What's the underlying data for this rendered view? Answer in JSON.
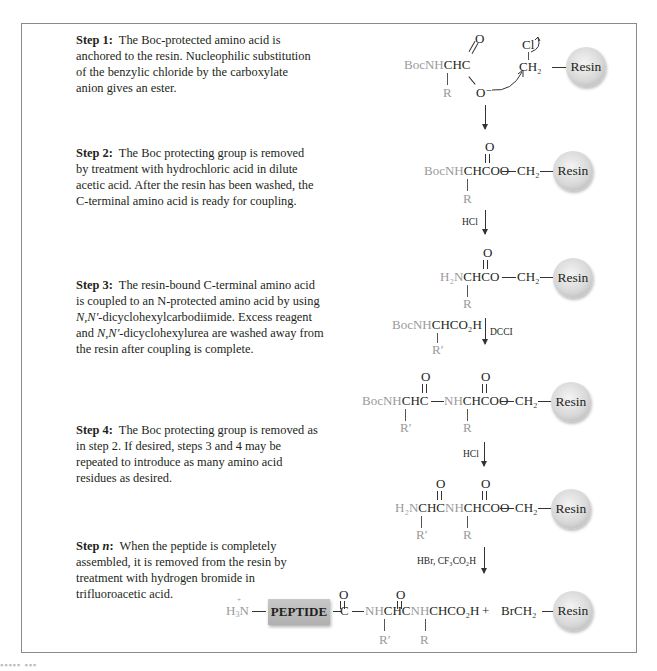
{
  "steps": [
    {
      "label": "Step 1:",
      "text": "The Boc-protected amino acid is anchored to the resin. Nucleophilic substitution of the benzylic chloride by the carboxylate anion gives an ester."
    },
    {
      "label": "Step 2:",
      "text": "The Boc protecting group is removed by treatment with hydrochloric acid in dilute acetic acid. After the resin has been washed, the C-terminal amino acid is ready for coupling."
    },
    {
      "label": "Step 3:",
      "text_before": "The resin-bound C-terminal amino acid is coupled to an N-protected amino acid by using ",
      "italic1": "N,N′",
      "text_mid": "-dicyclohexylcarbodiimide. Excess reagent and ",
      "italic2": "N,N′",
      "text_after": "-dicyclohexylurea are washed away from the resin after coupling is complete."
    },
    {
      "label": "Step 4:",
      "text": "The Boc protecting group is removed as in step 2. If desired, steps 3 and 4 may be repeated to introduce as many amino acid residues as desired."
    },
    {
      "label": "Step ",
      "label_italic": "n",
      "label_colon": ":",
      "text": "When the peptide is completely assembled, it is removed from the resin by treatment with hydrogen bromide in trifluoroacetic acid."
    }
  ],
  "reagents": {
    "step2": "HCl",
    "step3": "DCCI",
    "step4": "HCl",
    "stepn": "HBr, CF₃CO₂H"
  },
  "chem": {
    "boc": "Boc",
    "nh": "NH",
    "h2n": "H₂N",
    "chc": "CHC",
    "chco": "CHCO",
    "o": "O",
    "o_minus": "O⁻",
    "cl": "Cl",
    "ch2": "CH₂",
    "r": "R",
    "r_prime": "R′",
    "resin": "Resin",
    "peptide": "PEPTIDE",
    "boc_aa": "CHCO₂H",
    "c": "C",
    "chcnh": "CHCNH",
    "product_tail": "CHCO₂H",
    "plus": "+",
    "brch2": "BrCH₂",
    "h3n_plus": "+"
  },
  "caption": "..."
}
